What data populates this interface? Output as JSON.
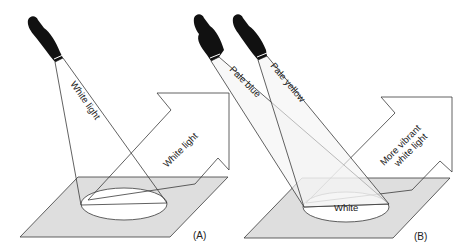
{
  "colors": {
    "line": "#3a3a3a",
    "plane_fill": "#dedede",
    "beam_fill": "#f2f2f2",
    "flashlight": "#111111",
    "background": "#ffffff"
  },
  "panel_a": {
    "label": "(A)",
    "beam_label": "White light",
    "reflected_label": "White light"
  },
  "panel_b": {
    "label": "(B)",
    "beam1_label": "Pale blue",
    "beam2_label": "Pale yellow",
    "spot_label": "White",
    "reflected_label_line1": "More vibrant",
    "reflected_label_line2": "white light"
  }
}
